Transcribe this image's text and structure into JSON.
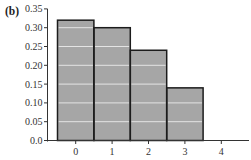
{
  "figure": {
    "panel_label": "(b)"
  },
  "chart_data": {
    "type": "bar",
    "title": "",
    "xlabel": "",
    "ylabel": "",
    "categories": [
      "0",
      "1",
      "2",
      "3",
      "4"
    ],
    "values": [
      0.32,
      0.3,
      0.24,
      0.14,
      0.0
    ],
    "ylim": [
      0,
      0.35
    ],
    "yticks": [
      0.0,
      0.05,
      0.1,
      0.15,
      0.2,
      0.25,
      0.3,
      0.35
    ],
    "ytick_labels": [
      "0.0",
      "0.05",
      "0.10",
      "0.15",
      "0.20",
      "0.25",
      "0.30",
      "0.35"
    ],
    "xtick_labels": [
      "0",
      "1",
      "2",
      "3",
      "4"
    ],
    "grid": "horizontal light lines at each y tick, visible only inside bars",
    "legend": null,
    "colors": {
      "bar_fill": "#a6a6a6",
      "bar_edge": "#1c1c1c",
      "gridline": "#e4e4e4",
      "axis": "#333333"
    }
  }
}
